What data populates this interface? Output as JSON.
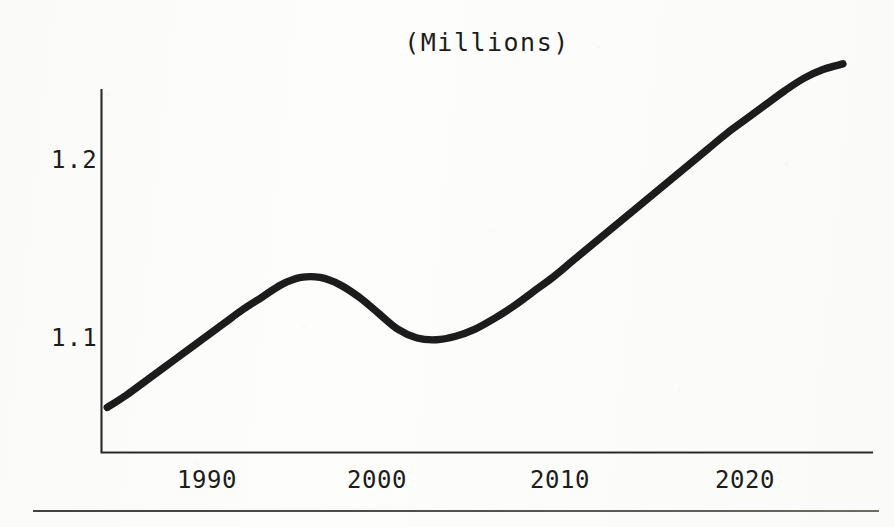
{
  "page": {
    "width": 894,
    "height": 527,
    "background_color": "#fdfdfc",
    "ink_color": "#1a1a1a"
  },
  "chart": {
    "title": "(Millions)",
    "y_axis_ticks": [
      "1.2",
      "1.1"
    ],
    "x_axis_ticks": [
      "1990",
      "2000",
      "2010",
      "2020"
    ]
  },
  "footer": {
    "rule_color": "#55534f"
  },
  "chart_data": {
    "type": "line",
    "title": "(Millions)",
    "subtitle": "",
    "xlabel": "",
    "ylabel": "",
    "units": "Millions",
    "grid": false,
    "legend": null,
    "legend_position": "none",
    "axis_style": "L-shaped spine (left + bottom only), no tick marks",
    "xlim": [
      1984.7,
      2024.5
    ],
    "ylim": [
      1.042,
      1.262
    ],
    "x_tick_values": [
      1990,
      2000,
      2010,
      2020
    ],
    "x_tick_labels": [
      "1990",
      "2000",
      "2010",
      "2020"
    ],
    "y_tick_values": [
      1.1,
      1.2
    ],
    "y_tick_labels": [
      "1.1",
      "1.2"
    ],
    "series": [
      {
        "name": "Population",
        "x": [
          1985,
          1986,
          1987,
          1988,
          1989,
          1990,
          1991,
          1992,
          1993,
          1994,
          1995,
          1996,
          1997,
          1998,
          1999,
          2000,
          2001,
          2002,
          2003,
          2004,
          2005,
          2006,
          2007,
          2008,
          2009,
          2010,
          2011,
          2012,
          2013,
          2014,
          2015,
          2016,
          2017,
          2018,
          2019,
          2020,
          2021,
          2022,
          2023
        ],
        "y": [
          1.061,
          1.068,
          1.076,
          1.084,
          1.092,
          1.1,
          1.108,
          1.116,
          1.123,
          1.13,
          1.134,
          1.134,
          1.13,
          1.123,
          1.114,
          1.105,
          1.1,
          1.099,
          1.101,
          1.105,
          1.111,
          1.118,
          1.126,
          1.134,
          1.143,
          1.152,
          1.161,
          1.17,
          1.179,
          1.188,
          1.197,
          1.206,
          1.215,
          1.223,
          1.231,
          1.239,
          1.246,
          1.251,
          1.254
        ]
      }
    ],
    "annotations": [
      {
        "label": "local peak",
        "x": 1995,
        "y": 1.134
      },
      {
        "label": "local trough",
        "x": 2002,
        "y": 1.099
      },
      {
        "label": "series end",
        "x": 2023,
        "y": 1.254
      }
    ]
  }
}
